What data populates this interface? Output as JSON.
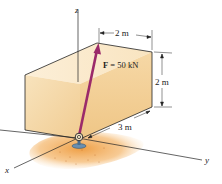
{
  "figure": {
    "force_label": "F = 50 kN",
    "force_symbol": "F",
    "force_value": "50 kN",
    "axes": {
      "x": "x",
      "y": "y",
      "z": "z"
    },
    "dimensions": {
      "top_width": "2 m",
      "height": "2 m",
      "depth": "3 m"
    },
    "colors": {
      "force_arrow": "#9b2a6a",
      "box_front": "#f6dcb0",
      "box_top": "#fbeed6",
      "box_side": "#f3d09a",
      "ground": "#f0a44a",
      "anchor": "#6a8fb0",
      "axis_line": "#222222"
    }
  }
}
